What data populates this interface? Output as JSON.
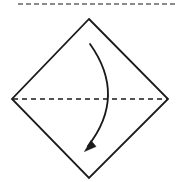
{
  "figure": {
    "width": 179,
    "height": 182,
    "background_color": "#ffffff",
    "ink_color": "#1a1a1a",
    "crop_remnant_color": "#8c8c8c"
  },
  "shapes": {
    "diamond": {
      "name": "square-sheet-rotated",
      "stroke_color": "#1a1a1a",
      "stroke_width": 1.8,
      "fill": "none",
      "vertices": {
        "top": {
          "x": 89,
          "y": 19
        },
        "right": {
          "x": 168,
          "y": 99
        },
        "bottom": {
          "x": 89,
          "y": 178
        },
        "left": {
          "x": 12,
          "y": 99
        }
      },
      "points": "89,19 168,99 89,178 12,99"
    },
    "fold_line": {
      "name": "horizontal-fold-line",
      "style": "dashed",
      "stroke_color": "#1a1a1a",
      "stroke_width": 1.6,
      "dash_pattern": "5 4",
      "x1": 13,
      "y1": 99,
      "x2": 167,
      "y2": 99
    },
    "fold_arrow": {
      "name": "fold-direction-arrow",
      "stroke_color": "#1a1a1a",
      "stroke_width": 1.8,
      "start": {
        "x": 90,
        "y": 44
      },
      "end": {
        "x": 88,
        "y": 146
      },
      "control": {
        "x": 127,
        "y": 96
      },
      "path": "M 90 44 Q 127 96 88 146",
      "arrowhead": {
        "tip": {
          "x": 84.5,
          "y": 151.5
        },
        "points": "84.5,151.5 95,145.5 90.5,141 ",
        "fill": "#1a1a1a",
        "rotation_deg": 228
      }
    },
    "crop_remnant": {
      "name": "top-cropped-dashed-line",
      "style": "dashed",
      "stroke_color": "#8c8c8c",
      "stroke_width": 2.2,
      "dash_pattern": "5 3",
      "x1": 18,
      "y1": 4,
      "x2": 176,
      "y2": 4
    }
  }
}
